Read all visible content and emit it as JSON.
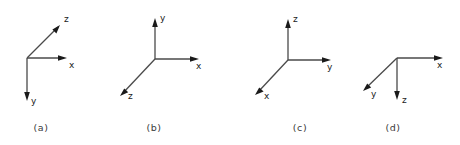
{
  "figure": {
    "background_color": "#ffffff",
    "line_color": "#4a4a4a",
    "arrow_color": "#1a1a1a",
    "label_color": "#1a1a1a",
    "caption_color": "#3a3a3a",
    "panels": [
      {
        "caption": "(a)",
        "caption_x": 41,
        "caption_y": 131,
        "origin_x": 27,
        "origin_y": 58,
        "axes": [
          {
            "label": "x",
            "label_x": 69,
            "label_y": 68,
            "tip_x": 67,
            "tip_y": 58,
            "direction": "right"
          },
          {
            "label": "y",
            "label_x": 31,
            "label_y": 104,
            "tip_x": 27,
            "tip_y": 101,
            "direction": "down"
          },
          {
            "label": "z",
            "label_x": 64,
            "label_y": 22,
            "tip_x": 60,
            "tip_y": 25,
            "direction": "up-right"
          }
        ]
      },
      {
        "caption": "(b)",
        "caption_x": 154,
        "caption_y": 131,
        "origin_x": 155,
        "origin_y": 59,
        "axes": [
          {
            "label": "y",
            "label_x": 160,
            "label_y": 21,
            "tip_x": 155,
            "tip_y": 18,
            "direction": "up"
          },
          {
            "label": "x",
            "label_x": 196,
            "label_y": 69,
            "tip_x": 199,
            "tip_y": 59,
            "direction": "right"
          },
          {
            "label": "z",
            "label_x": 128,
            "label_y": 99,
            "tip_x": 120,
            "tip_y": 96,
            "direction": "down-left"
          }
        ]
      },
      {
        "caption": "(c)",
        "caption_x": 300,
        "caption_y": 131,
        "origin_x": 288,
        "origin_y": 60,
        "axes": [
          {
            "label": "z",
            "label_x": 293,
            "label_y": 22,
            "tip_x": 288,
            "tip_y": 19,
            "direction": "up"
          },
          {
            "label": "y",
            "label_x": 327,
            "label_y": 70,
            "tip_x": 331,
            "tip_y": 60,
            "direction": "right"
          },
          {
            "label": "x",
            "label_x": 264,
            "label_y": 99,
            "tip_x": 255,
            "tip_y": 95,
            "direction": "down-left"
          }
        ]
      },
      {
        "caption": "(d)",
        "caption_x": 393,
        "caption_y": 131,
        "origin_x": 397,
        "origin_y": 58,
        "axes": [
          {
            "label": "x",
            "label_x": 437,
            "label_y": 68,
            "tip_x": 443,
            "tip_y": 58,
            "direction": "right"
          },
          {
            "label": "z",
            "label_x": 402,
            "label_y": 103,
            "tip_x": 397,
            "tip_y": 100,
            "direction": "down"
          },
          {
            "label": "y",
            "label_x": 371,
            "label_y": 97,
            "tip_x": 363,
            "tip_y": 91,
            "direction": "down-left"
          }
        ]
      }
    ]
  }
}
